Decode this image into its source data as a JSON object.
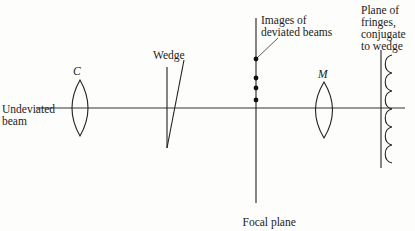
{
  "diagram": {
    "labels": {
      "undeviated_beam": "Undeviated\nbeam",
      "lens_c": "C",
      "wedge": "Wedge",
      "images": "Images of\ndeviated beams",
      "lens_m": "M",
      "plane_of_fringes": "Plane of\nfringes,\nconjugate\nto wedge",
      "focal_plane_line1": "Focal plane",
      "focal_plane_of": "of ",
      "focal_plane_m": "M"
    },
    "elements": {
      "optical_axis_y": 108,
      "lens_c_x": 80,
      "wedge_x": 168,
      "focal_plane_x": 256,
      "image_dots_y": [
        59,
        78,
        88,
        100
      ],
      "lens_m_x": 324,
      "fringe_plane_x": 381,
      "fringe_scallops": 6
    },
    "colors": {
      "ink": "#222222",
      "paper": "#fdfdfb"
    }
  }
}
